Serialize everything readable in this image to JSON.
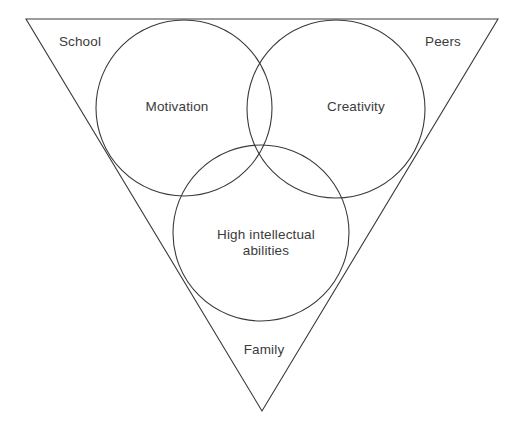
{
  "diagram": {
    "type": "venn-in-triangle",
    "background_color": "#ffffff",
    "stroke_color": "#3a3a3a",
    "text_color": "#3b3b3b",
    "canvas": {
      "width": 522,
      "height": 431
    },
    "triangle": {
      "name": "environment-triangle",
      "orientation": "inverted",
      "vertices": [
        {
          "name": "top-left",
          "x": 26,
          "y": 19
        },
        {
          "name": "top-right",
          "x": 498,
          "y": 19
        },
        {
          "name": "bottom",
          "x": 262,
          "y": 411
        }
      ],
      "corner_labels": [
        {
          "id": "school",
          "text": "School",
          "x": 80,
          "y": 42
        },
        {
          "id": "peers",
          "text": "Peers",
          "x": 443,
          "y": 42
        },
        {
          "id": "family",
          "text": "Family",
          "x": 264,
          "y": 350
        }
      ]
    },
    "circles": [
      {
        "id": "motivation",
        "text": "Motivation",
        "cx": 184,
        "cy": 108,
        "r": 88,
        "label_x": 177,
        "label_y": 107
      },
      {
        "id": "creativity",
        "text": "Creativity",
        "cx": 336,
        "cy": 109,
        "r": 89,
        "label_x": 356,
        "label_y": 107
      },
      {
        "id": "high-intellectual-abilities",
        "text": "High intellectual\nabilities",
        "cx": 261,
        "cy": 233,
        "r": 88,
        "label_x": 266,
        "label_y": 243
      }
    ]
  }
}
